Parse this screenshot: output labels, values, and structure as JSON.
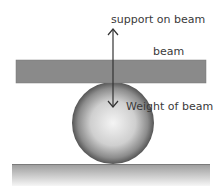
{
  "diagram": {
    "labels": {
      "support": "support on beam",
      "beam": "beam",
      "weight": "Weight of beam"
    },
    "colors": {
      "beam": "#8a8a8a",
      "ground_top": "#9a9a9a",
      "ground_bottom": "#f4f4f4",
      "sphere_edge": "#555555",
      "sphere_center": "#f2f2f2",
      "arrow": "#333333",
      "text": "#3a3a3a"
    }
  }
}
